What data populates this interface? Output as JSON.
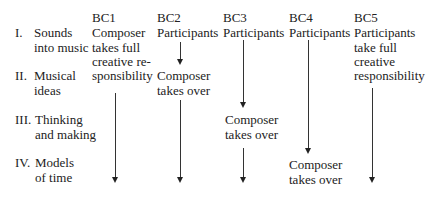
{
  "stages": [
    {
      "numeral": "I.",
      "line1": "Sounds",
      "line2": "into music"
    },
    {
      "numeral": "II.",
      "line1": "Musical",
      "line2": "ideas"
    },
    {
      "numeral": "III.",
      "line1": "Thinking",
      "line2": "and making"
    },
    {
      "numeral": "IV.",
      "line1": "Models",
      "line2": "of time"
    }
  ],
  "columns": [
    {
      "id": "BC1",
      "top": [
        "Composer",
        "takes full",
        "creative re-",
        "sponsibility"
      ]
    },
    {
      "id": "BC2",
      "top": [
        "Participants"
      ],
      "handover": [
        "Composer",
        "takes over"
      ]
    },
    {
      "id": "BC3",
      "top": [
        "Participants"
      ],
      "handover": [
        "Composer",
        "takes over"
      ]
    },
    {
      "id": "BC4",
      "top": [
        "Participants"
      ],
      "handover": [
        "Composer",
        "takes over"
      ]
    },
    {
      "id": "BC5",
      "top": [
        "Participants",
        "take full",
        "creative",
        "responsibility"
      ]
    }
  ]
}
